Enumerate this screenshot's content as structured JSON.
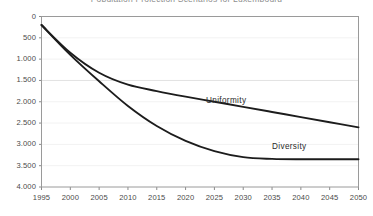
{
  "chart_data": {
    "type": "line",
    "title": "Population Projection Scenarios for Luxembourg",
    "xlabel": "",
    "ylabel": "",
    "xlim": [
      1995,
      2050
    ],
    "ylim": [
      0,
      4000
    ],
    "grid": true,
    "legend_position": "inline-annotation",
    "x": [
      1995,
      2000,
      2005,
      2010,
      2015,
      2020,
      2025,
      2030,
      2035,
      2040,
      2045,
      2050
    ],
    "x_tick_labels": [
      "1995",
      "2000",
      "2005",
      "2010",
      "2015",
      "2020",
      "2025",
      "2030",
      "2035",
      "2040",
      "2045",
      "2050"
    ],
    "y_ticks": [
      0,
      500,
      1000,
      1500,
      2000,
      2500,
      3000,
      3500,
      4000
    ],
    "y_tick_labels": [
      "0",
      "500",
      "1.000",
      "1.500",
      "2.000",
      "2.500",
      "3.000",
      "3.500",
      "4.000"
    ],
    "series": [
      {
        "name": "Uniformity",
        "color": "#1c1c1c",
        "label_x": 2025,
        "label_y": 2150,
        "values": [
          3800,
          3150,
          2680,
          2400,
          2250,
          2120,
          2000,
          1880,
          1760,
          1640,
          1520,
          1400
        ]
      },
      {
        "name": "Diversity",
        "color": "#1c1c1c",
        "label_x": 2037,
        "label_y": 1000,
        "values": [
          3800,
          3100,
          2480,
          1900,
          1430,
          1080,
          840,
          700,
          660,
          650,
          650,
          650
        ]
      }
    ]
  },
  "axes": {
    "y_labels": [
      "4.000",
      "3.500",
      "3.000",
      "2.500",
      "2.000",
      "1.500",
      "1.000",
      "500",
      "0"
    ],
    "x_labels": [
      "1995",
      "2000",
      "2005",
      "2010",
      "2015",
      "2020",
      "2025",
      "2030",
      "2035",
      "2040",
      "2045",
      "2050"
    ]
  },
  "annotations": {
    "uniformity": "Uniformity",
    "diversity": "Diversity"
  }
}
